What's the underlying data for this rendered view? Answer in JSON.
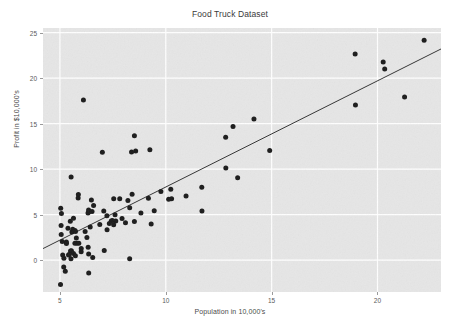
{
  "chart": {
    "title": "Food Truck Dataset",
    "xlabel": "Population in 10,000's",
    "ylabel": "Profit in $10,000's"
  },
  "chart_data": {
    "type": "scatter",
    "title": "Food Truck Dataset",
    "xlabel": "Population in 10,000's",
    "ylabel": "Profit in $10,000's",
    "xlim": [
      4.2,
      23.0
    ],
    "ylim": [
      -3.5,
      25.5
    ],
    "xticks": [
      5,
      10,
      15,
      20
    ],
    "yticks": [
      0,
      5,
      10,
      15,
      20,
      25
    ],
    "grid": true,
    "grid_color": "#ffffff",
    "plot_background": "#e6e6e6",
    "figure_background": "#ffffff",
    "legend": null,
    "marker_color": "#1a1a1a",
    "marker_size": 5,
    "series": [
      {
        "name": "Training data",
        "type": "scatter",
        "x": [
          6.1101,
          5.5277,
          8.5186,
          7.0032,
          5.8598,
          8.3829,
          7.4764,
          8.5781,
          6.4862,
          5.0546,
          5.7107,
          14.164,
          5.734,
          8.4084,
          5.6407,
          5.3794,
          6.3654,
          5.1301,
          6.4296,
          7.0708,
          6.1891,
          20.27,
          5.4901,
          6.3261,
          5.5649,
          18.945,
          12.828,
          10.957,
          13.176,
          22.203,
          5.2524,
          6.5894,
          9.2482,
          5.8918,
          8.2111,
          7.9334,
          8.0959,
          5.6063,
          12.836,
          6.3534,
          5.4069,
          6.8825,
          11.708,
          5.7737,
          7.8247,
          7.0931,
          5.0702,
          5.8014,
          11.7,
          5.5416,
          7.5402,
          5.3077,
          7.4239,
          7.6031,
          6.3328,
          6.3589,
          6.2742,
          5.6397,
          9.3102,
          9.4536,
          8.8254,
          5.1793,
          21.279,
          14.908,
          18.959,
          7.2182,
          8.2951,
          10.236,
          5.4994,
          20.341,
          10.136,
          7.3345,
          6.0062,
          7.2259,
          5.0269,
          6.5479,
          7.5386,
          5.0365,
          10.274,
          5.1077,
          5.7292,
          5.1884,
          6.3557,
          9.7687,
          6.5159,
          8.5172,
          9.1802,
          6.002,
          5.5204,
          5.0594,
          5.7077,
          7.6366,
          5.8707,
          5.3054,
          8.2934,
          13.394,
          5.4369
        ],
        "y": [
          17.592,
          9.1302,
          13.662,
          11.854,
          6.8233,
          11.886,
          4.3483,
          12.0,
          6.5987,
          3.8166,
          3.2522,
          15.505,
          3.1551,
          7.2258,
          0.71618,
          3.5129,
          5.3048,
          0.56077,
          3.6518,
          5.3893,
          3.1386,
          21.767,
          4.263,
          5.1875,
          3.0825,
          22.638,
          13.501,
          7.0467,
          14.692,
          24.147,
          -1.22,
          5.9966,
          12.134,
          1.8495,
          6.5426,
          4.5623,
          4.1164,
          3.3928,
          10.117,
          5.4974,
          0.55657,
          3.9115,
          5.3854,
          2.4406,
          6.7318,
          1.0463,
          5.1337,
          1.844,
          8.0043,
          1.0179,
          6.7504,
          1.8396,
          4.2885,
          4.9981,
          1.4233,
          -1.4211,
          2.4756,
          4.6042,
          3.9624,
          5.4141,
          5.1694,
          -0.74279,
          17.929,
          12.054,
          17.054,
          4.8852,
          5.7442,
          7.7754,
          1.0173,
          20.992,
          6.6799,
          4.0259,
          1.2784,
          3.3411,
          -2.6807,
          0.29678,
          3.8845,
          5.7014,
          6.7526,
          2.0576,
          0.47953,
          0.20421,
          0.67861,
          7.5435,
          5.3436,
          4.2415,
          6.7981,
          0.92695,
          0.152,
          2.8214,
          1.8451,
          4.2959,
          7.2029,
          1.9869,
          0.14454,
          9.0551,
          0.61705
        ]
      },
      {
        "name": "Linear regression fit",
        "type": "line",
        "color": "#333333",
        "intercept": -3.6303,
        "slope": 1.1664,
        "x": [
          4.2,
          23.0
        ],
        "y": [
          1.269,
          23.195
        ]
      }
    ]
  }
}
